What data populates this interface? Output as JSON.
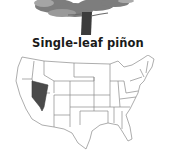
{
  "species": {
    "common_name": "Single-leaf piñon"
  },
  "illustration": {
    "icon": "pine-tree-icon",
    "foliage_color": "#7a7a7a",
    "trunk_color": "#3a3a3a"
  },
  "range_map": {
    "icon": "us-map-icon",
    "highlighted_states": [
      "Nevada"
    ],
    "highlight_color": "#4a4a4a",
    "outline_color": "#8a8a8a"
  }
}
